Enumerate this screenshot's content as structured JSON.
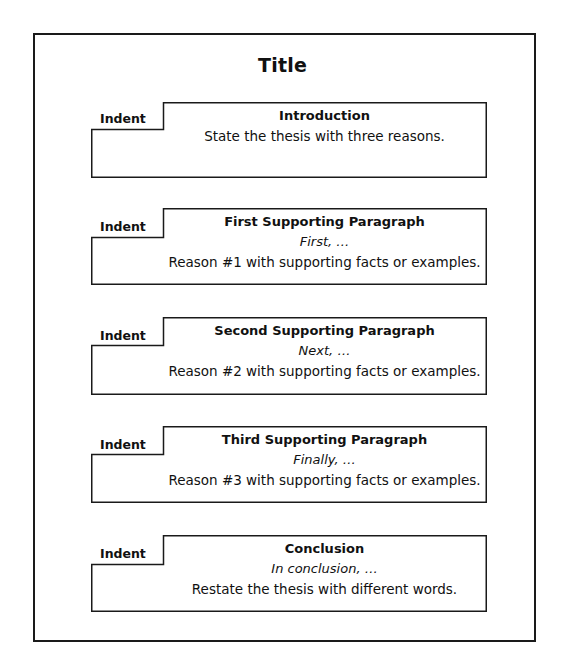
{
  "document": {
    "title": "Title",
    "blocks": [
      {
        "indent_label": "Indent",
        "heading": "Introduction",
        "lead": "",
        "body": "State the thesis with three reasons."
      },
      {
        "indent_label": "Indent",
        "heading": "First Supporting Paragraph",
        "lead": "First, …",
        "body": "Reason #1 with supporting facts or examples."
      },
      {
        "indent_label": "Indent",
        "heading": "Second Supporting Paragraph",
        "lead": "Next, …",
        "body": "Reason #2 with supporting facts or examples."
      },
      {
        "indent_label": "Indent",
        "heading": "Third Supporting Paragraph",
        "lead": "Finally, …",
        "body": "Reason #3 with supporting facts or examples."
      },
      {
        "indent_label": "Indent",
        "heading": "Conclusion",
        "lead": "In conclusion, …",
        "body": "Restate the thesis with different words."
      }
    ]
  },
  "colors": {
    "line": "#1a1a1a",
    "text": "#111111",
    "background": "#ffffff"
  }
}
